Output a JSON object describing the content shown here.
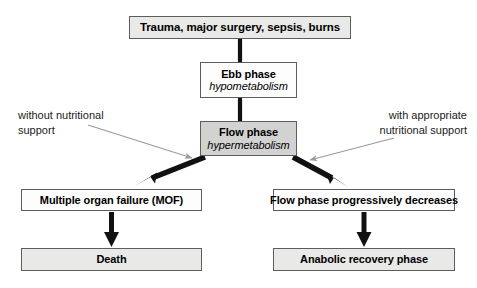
{
  "diagram": {
    "colors": {
      "box_fill_light": "#e9e9e7",
      "box_fill_mid": "#d2d2d0",
      "box_fill_white": "#fdfdfd",
      "box_border": "#5d5d5d",
      "connector": "#111111",
      "annotation_arrow": "#9a9a9a",
      "text": "#000000",
      "background": "#ffffff"
    },
    "nodes": {
      "trauma": {
        "title": "Trauma, major surgery, sepsis, burns",
        "subtitle": ""
      },
      "ebb": {
        "title": "Ebb phase",
        "subtitle": "hypometabolism"
      },
      "flow": {
        "title": "Flow phase",
        "subtitle": "hypermetabolism"
      },
      "mof": {
        "title": "Multiple organ failure (MOF)",
        "subtitle": ""
      },
      "decrease": {
        "title": "Flow phase progressively decreases",
        "subtitle": ""
      },
      "death": {
        "title": "Death",
        "subtitle": ""
      },
      "anabolic": {
        "title": "Anabolic recovery phase",
        "subtitle": ""
      }
    },
    "annotations": {
      "left": "without nutritional\nsupport",
      "right": "with appropriate\nnutritional support"
    },
    "connectors": [
      {
        "name": "trauma-to-ebb",
        "type": "line",
        "style": "thick-plain"
      },
      {
        "name": "ebb-to-flow",
        "type": "line",
        "style": "thick-plain"
      },
      {
        "name": "flow-to-mof",
        "type": "arrow",
        "style": "thick-diagonal-left"
      },
      {
        "name": "flow-to-decrease",
        "type": "arrow",
        "style": "thick-diagonal-right"
      },
      {
        "name": "mof-to-death",
        "type": "arrow",
        "style": "thick-vertical"
      },
      {
        "name": "decrease-to-anabolic",
        "type": "arrow",
        "style": "thick-vertical"
      },
      {
        "name": "left-annotation-pointer",
        "type": "arrow",
        "style": "thin-gray"
      },
      {
        "name": "right-annotation-pointer",
        "type": "arrow",
        "style": "thin-gray"
      }
    ]
  }
}
